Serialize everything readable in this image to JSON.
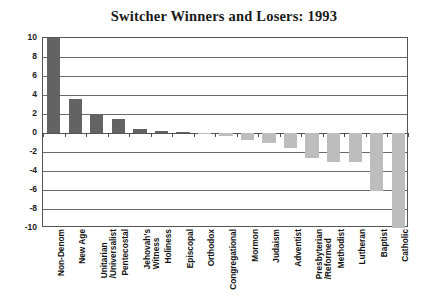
{
  "chart_data": {
    "type": "bar",
    "title": "Switcher Winners and Losers: 1993",
    "xlabel": "",
    "ylabel": "",
    "ylim": [
      -10,
      10
    ],
    "ytick_step": 2,
    "yticks": [
      "10",
      "8",
      "6",
      "4",
      "2",
      "0",
      "-2",
      "-4",
      "-6",
      "-8",
      "-10"
    ],
    "grid": true,
    "legend": "none",
    "colors": {
      "positive_bar": "#636363",
      "negative_bar": "#bdbdbd",
      "axis": "#555555",
      "text": "#111111"
    },
    "categories": [
      "Non-Denom",
      "New Age",
      "Unitarian\n/Universalist",
      "Pentecostal",
      "Jehovah's\nWitness",
      "Holiness",
      "Episcopal",
      "Orthodox",
      "Congregational",
      "Mormon",
      "Judaism",
      "Adventist",
      "Presbyterian\n/Reformed",
      "Methodist",
      "Lutheran",
      "Baptist",
      "Catholic"
    ],
    "values": [
      10.0,
      3.6,
      2.0,
      1.5,
      0.4,
      0.2,
      0.05,
      -0.1,
      -0.3,
      -0.7,
      -1.1,
      -1.6,
      -2.6,
      -3.1,
      -3.1,
      -6.1,
      -10.0
    ]
  },
  "axis_labels": {
    "categories_rendered": [
      {
        "line1": "Non-Denom",
        "line2": ""
      },
      {
        "line1": "New Age",
        "line2": ""
      },
      {
        "line1": "Unitarian",
        "line2": "/Universalist"
      },
      {
        "line1": "Pentecostal",
        "line2": ""
      },
      {
        "line1": "Jehovah's",
        "line2": "Witness"
      },
      {
        "line1": "Holiness",
        "line2": ""
      },
      {
        "line1": "Episcopal",
        "line2": ""
      },
      {
        "line1": "Orthodox",
        "line2": ""
      },
      {
        "line1": "Congregational",
        "line2": ""
      },
      {
        "line1": "Mormon",
        "line2": ""
      },
      {
        "line1": "Judaism",
        "line2": ""
      },
      {
        "line1": "Adventist",
        "line2": ""
      },
      {
        "line1": "Presbyterian",
        "line2": "/Reformed"
      },
      {
        "line1": "Methodist",
        "line2": ""
      },
      {
        "line1": "Lutheran",
        "line2": ""
      },
      {
        "line1": "Baptist",
        "line2": ""
      },
      {
        "line1": "Catholic",
        "line2": ""
      }
    ]
  }
}
